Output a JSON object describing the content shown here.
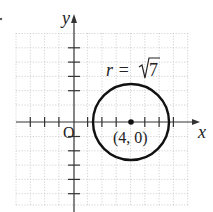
{
  "figure": {
    "x_axis_label": "x",
    "y_axis_label": "y",
    "origin_label": "O",
    "center_label": "(4, 0)",
    "radius_label_prefix": "r = ",
    "radius_label_value": "7",
    "center": [
      4,
      0
    ],
    "radius": 2.6458,
    "equation": "(x - 4)^2 + y^2 = 7",
    "x_ticks": [
      -4,
      -3,
      -2,
      -1,
      1,
      2,
      3,
      4,
      5,
      6,
      7,
      8
    ],
    "y_ticks": [
      -5,
      -4,
      -3,
      -2,
      -1,
      1,
      2,
      3,
      4
    ],
    "colors": {
      "curve": "#111111",
      "axes": "#333333",
      "grid": "#c8c8c8"
    }
  }
}
